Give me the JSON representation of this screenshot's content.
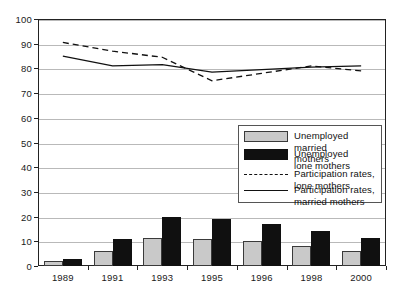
{
  "chart_data": {
    "type": "bar",
    "title": "",
    "xlabel": "",
    "ylabel": "",
    "ylim": [
      0,
      100
    ],
    "ytick_values": [
      0,
      10,
      20,
      30,
      40,
      50,
      60,
      70,
      80,
      90,
      100
    ],
    "ytick_labels": [
      "0",
      "10",
      "20",
      "30",
      "40",
      "50",
      "60",
      "70",
      "80",
      "90",
      "100"
    ],
    "grid": true,
    "legend_position": "center-right",
    "categories": [
      "1989",
      "1991",
      "1993",
      "1995",
      "1996",
      "1998",
      "2000"
    ],
    "series": [
      {
        "name": "Unemployed married mothers",
        "kind": "bar",
        "color": "#c9c9c9",
        "values": [
          2,
          6,
          11.5,
          11,
          10,
          8,
          6
        ]
      },
      {
        "name": "Unemployed lone mothers",
        "kind": "bar",
        "color": "#101010",
        "values": [
          3,
          11,
          20,
          19,
          17,
          14,
          11.5
        ]
      },
      {
        "name": "Participation rates, lone mothers",
        "kind": "line-dashed",
        "color": "#111111",
        "values": [
          90.5,
          87,
          84.5,
          75,
          78,
          81,
          79
        ]
      },
      {
        "name": "Participation rates, married mothers",
        "kind": "line-solid",
        "color": "#111111",
        "values": [
          85,
          81,
          81.5,
          78.5,
          79.5,
          80.5,
          81
        ]
      }
    ]
  },
  "legend": {
    "items": [
      {
        "label": "Unemployed married\nmothers",
        "marker": "swatch-grey"
      },
      {
        "label": "Unemployed\nlone mothers",
        "marker": "swatch-black"
      },
      {
        "label": "Participation rates,\nlone mothers",
        "marker": "line-dashed"
      },
      {
        "label": "Participation rates,\nmarried mothers",
        "marker": "line-solid"
      }
    ]
  }
}
